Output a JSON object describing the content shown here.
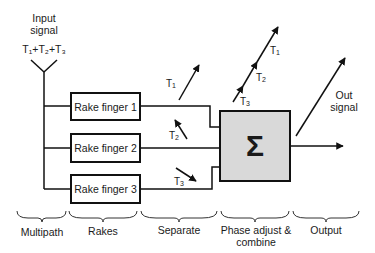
{
  "input": {
    "title_line1": "Input",
    "title_line2": "signal",
    "sum_label": "T₁+T₂+T₃"
  },
  "fingers": [
    {
      "label": "Rake finger 1"
    },
    {
      "label": "Rake finger 2"
    },
    {
      "label": "Rake finger 3"
    }
  ],
  "separate_arrows": [
    {
      "label": "T",
      "sub": "1",
      "direction": "up-right"
    },
    {
      "label": "T",
      "sub": "2",
      "direction": "up-left"
    },
    {
      "label": "T",
      "sub": "3",
      "direction": "down-right"
    }
  ],
  "combined_arrow": {
    "labels": [
      {
        "label": "T",
        "sub": "1"
      },
      {
        "label": "T",
        "sub": "2"
      },
      {
        "label": "T",
        "sub": "3"
      }
    ]
  },
  "combiner": {
    "symbol": "Σ"
  },
  "output": {
    "line1": "Out",
    "line2": "signal"
  },
  "stages": [
    {
      "label": "Multipath"
    },
    {
      "label": "Rakes"
    },
    {
      "label": "Separate"
    },
    {
      "label": "Phase adjust &",
      "label2": "combine"
    },
    {
      "label": "Output"
    }
  ],
  "colors": {
    "line": "#111111",
    "combiner_fill": "#d9d9d9",
    "background": "#ffffff"
  }
}
